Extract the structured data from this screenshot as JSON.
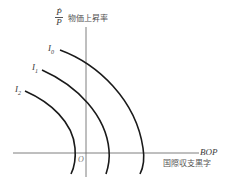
{
  "diagram": {
    "y_axis": {
      "symbol_numerator": "Ṗ",
      "symbol_denominator": "P",
      "label": "物価上昇率"
    },
    "x_axis": {
      "symbol": "BOP",
      "label": "国際収支黒字"
    },
    "origin_label": "O",
    "curves": [
      {
        "name": "I0",
        "base": "I",
        "subscript": "0"
      },
      {
        "name": "I1",
        "base": "I",
        "subscript": "1"
      },
      {
        "name": "I2",
        "base": "I",
        "subscript": "2"
      }
    ],
    "colors": {
      "axis": "#707070",
      "curve": "#1a1a1a",
      "text": "#3a3a3a"
    }
  }
}
